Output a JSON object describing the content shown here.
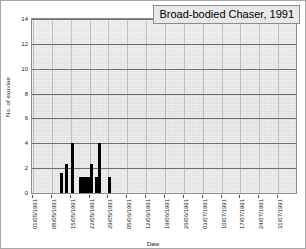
{
  "chart_data": {
    "type": "bar",
    "title": "Broad-bodied Chaser, 1991",
    "xlabel": "Date",
    "ylabel": "No. of exuviae",
    "ylim": [
      0,
      14
    ],
    "y_ticks": [
      0,
      2,
      4,
      6,
      8,
      10,
      12,
      14
    ],
    "grid": true,
    "legend": "none",
    "x_tick_labels": [
      "01/05/1991",
      "08/05/1991",
      "15/05/1991",
      "22/05/1991",
      "29/05/1991",
      "05/06/1991",
      "12/06/1991",
      "19/06/1991",
      "26/06/1991",
      "03/07/1991",
      "10/07/1991",
      "17/07/1991",
      "24/07/1991",
      "31/07/1991"
    ],
    "categories": [
      "11/05/1991",
      "12/05/1991",
      "13/05/1991",
      "14/05/1991",
      "15/05/1991",
      "16/05/1991",
      "17/05/1991",
      "18/05/1991",
      "19/05/1991",
      "20/05/1991",
      "21/05/1991",
      "22/05/1991",
      "23/05/1991",
      "24/05/1991",
      "25/05/1991",
      "26/05/1991",
      "27/05/1991",
      "28/05/1991",
      "29/05/1991",
      "30/05/1991",
      "31/05/1991",
      "01/06/1991"
    ],
    "values": [
      1.6,
      0,
      2.3,
      0,
      4.0,
      0,
      0,
      1.3,
      1.3,
      1.3,
      1.3,
      2.3,
      0,
      1.3,
      4.0,
      0,
      0,
      0,
      1.3,
      0,
      0,
      0
    ],
    "bar_color": "#000000",
    "plot_background": "#e8e8e8"
  },
  "axes": {
    "y_title": "No. of exuviae",
    "x_title": "Date"
  }
}
